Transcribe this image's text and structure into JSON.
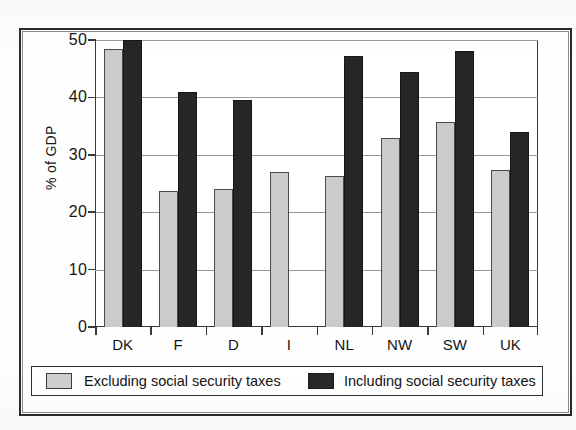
{
  "chart_data": {
    "type": "bar",
    "title": "",
    "subtitle": "",
    "xlabel": "",
    "ylabel": "% of GDP",
    "ylim": [
      0,
      50
    ],
    "yticks": [
      0,
      10,
      20,
      30,
      40,
      50
    ],
    "ytick_labels": [
      "0",
      "10",
      "20",
      "30",
      "40",
      "50"
    ],
    "grid": true,
    "grid_axis": "y",
    "legend_position": "bottom",
    "categories": [
      "DK",
      "F",
      "D",
      "I",
      "NL",
      "NW",
      "SW",
      "UK"
    ],
    "series": [
      {
        "name": "Excluding social security taxes",
        "color": "#cbcbcb",
        "values": [
          48.5,
          23.7,
          24.0,
          27.0,
          26.3,
          33.0,
          35.8,
          27.4
        ]
      },
      {
        "name": "Including social security taxes",
        "color": "#262626",
        "values": [
          50.0,
          41.0,
          39.5,
          null,
          47.3,
          44.5,
          48.0,
          34.0
        ]
      }
    ]
  },
  "legend": {
    "entries": [
      {
        "label": "Excluding social security taxes",
        "swatch": "light-gray-swatch"
      },
      {
        "label": "Including social security taxes",
        "swatch": "dark-swatch"
      }
    ]
  },
  "axes": {
    "y_title": "% of GDP"
  }
}
